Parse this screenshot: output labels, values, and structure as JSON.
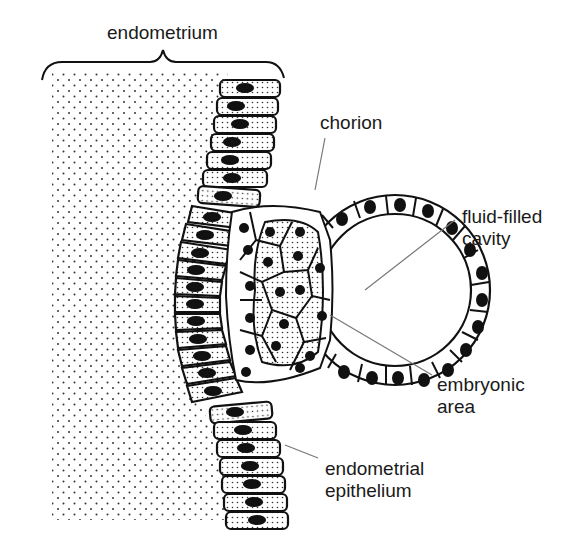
{
  "figure": {
    "type": "biology-diagram",
    "labels": {
      "endometrium": "endometrium",
      "chorion": "chorion",
      "cavity": "fluid-filled\ncavity",
      "embryonic": "embryonic\narea",
      "epithelium": "endometrial\nepithelium"
    },
    "caption_visible": "(caption cut off at bottom edge)",
    "colors": {
      "line": "#111111",
      "leader": "#777777",
      "nucleus": "#111111",
      "background": "#ffffff"
    }
  }
}
